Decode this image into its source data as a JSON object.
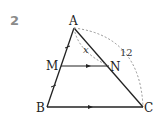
{
  "problem_number": "2",
  "points": {
    "A": {
      "label": "A",
      "x": 74,
      "y": 28
    },
    "M": {
      "label": "M",
      "x": 61,
      "y": 66
    },
    "N": {
      "label": "N",
      "x": 109,
      "y": 66
    },
    "B": {
      "label": "B",
      "x": 47,
      "y": 107
    },
    "C": {
      "label": "C",
      "x": 143,
      "y": 107
    }
  },
  "labels": {
    "x": "x",
    "ac_length": "12"
  },
  "colors": {
    "line": "#222222",
    "dashed": "#888888",
    "number": "#8a8a8a"
  }
}
